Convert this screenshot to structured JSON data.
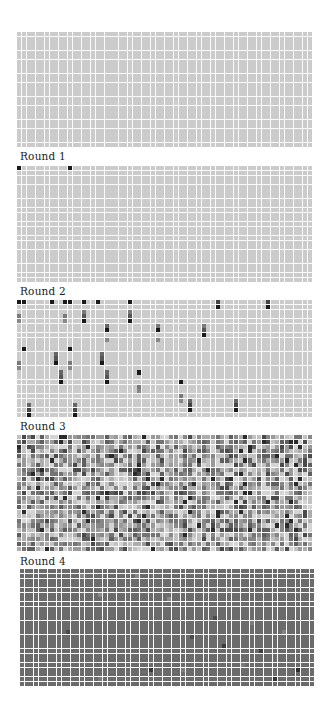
{
  "figure": {
    "top_text_bleed": "",
    "grid": {
      "cols": 64,
      "rows": 25
    },
    "colors": {
      "empty_light": "#c9c9c9",
      "black": "#1a1a1a",
      "dark": "#444444",
      "mid": "#7a7a7a",
      "light_mid": "#a8a8a8",
      "round4_base": "#6e6e6e"
    },
    "panels": [
      {
        "id": "initial",
        "label": "",
        "top": 32,
        "left": 17,
        "width": 295,
        "height": 115,
        "mode": "uniform",
        "base": "#cbcbcb",
        "cells": []
      },
      {
        "id": "round-1",
        "label": "Round 1",
        "label_top": 150,
        "top": 166,
        "left": 17,
        "width": 295,
        "height": 116,
        "mode": "sparse",
        "base": "#cbcbcb",
        "cells": [
          [
            0,
            0,
            "#1a1a1a"
          ],
          [
            11,
            0,
            "#1a1a1a"
          ]
        ]
      },
      {
        "id": "round-2",
        "label": "Round 2",
        "label_top": 285,
        "top": 300,
        "left": 17,
        "width": 295,
        "height": 117,
        "mode": "sparse",
        "base": "#cbcbcb",
        "cells": [
          [
            0,
            0,
            "#1a1a1a"
          ],
          [
            1,
            0,
            "#1a1a1a"
          ],
          [
            7,
            0,
            "#1a1a1a"
          ],
          [
            10,
            0,
            "#1a1a1a"
          ],
          [
            11,
            0,
            "#1a1a1a"
          ],
          [
            14,
            0,
            "#1a1a1a"
          ],
          [
            17,
            0,
            "#1a1a1a"
          ],
          [
            24,
            0,
            "#1a1a1a"
          ],
          [
            43,
            0,
            "#444444"
          ],
          [
            43,
            1,
            "#1a1a1a"
          ],
          [
            54,
            0,
            "#444444"
          ],
          [
            54,
            1,
            "#1a1a1a"
          ],
          [
            0,
            3,
            "#7a7a7a"
          ],
          [
            0,
            4,
            "#888888"
          ],
          [
            10,
            3,
            "#7a7a7a"
          ],
          [
            10,
            4,
            "#888888"
          ],
          [
            14,
            2,
            "#7a7a7a"
          ],
          [
            14,
            3,
            "#555555"
          ],
          [
            14,
            4,
            "#1a1a1a"
          ],
          [
            24,
            2,
            "#7a7a7a"
          ],
          [
            24,
            3,
            "#555555"
          ],
          [
            24,
            4,
            "#1a1a1a"
          ],
          [
            19,
            5,
            "#666666"
          ],
          [
            19,
            6,
            "#1a1a1a"
          ],
          [
            30,
            5,
            "#7a7a7a"
          ],
          [
            30,
            6,
            "#1a1a1a"
          ],
          [
            40,
            5,
            "#7a7a7a"
          ],
          [
            40,
            6,
            "#555555"
          ],
          [
            40,
            7,
            "#1a1a1a"
          ],
          [
            19,
            8,
            "#888888"
          ],
          [
            30,
            8,
            "#888888"
          ],
          [
            1,
            10,
            "#1a1a1a"
          ],
          [
            11,
            10,
            "#1a1a1a"
          ],
          [
            8,
            11,
            "#666666"
          ],
          [
            8,
            12,
            "#555555"
          ],
          [
            8,
            13,
            "#1a1a1a"
          ],
          [
            18,
            11,
            "#666666"
          ],
          [
            18,
            12,
            "#555555"
          ],
          [
            18,
            13,
            "#1a1a1a"
          ],
          [
            0,
            13,
            "#7a7a7a"
          ],
          [
            0,
            14,
            "#888888"
          ],
          [
            11,
            13,
            "#7a7a7a"
          ],
          [
            11,
            14,
            "#888888"
          ],
          [
            9,
            15,
            "#666666"
          ],
          [
            9,
            16,
            "#555555"
          ],
          [
            9,
            17,
            "#1a1a1a"
          ],
          [
            19,
            15,
            "#666666"
          ],
          [
            19,
            16,
            "#555555"
          ],
          [
            19,
            17,
            "#1a1a1a"
          ],
          [
            26,
            15,
            "#1a1a1a"
          ],
          [
            26,
            18,
            "#7a7a7a"
          ],
          [
            26,
            19,
            "#888888"
          ],
          [
            35,
            17,
            "#1a1a1a"
          ],
          [
            35,
            20,
            "#7a7a7a"
          ],
          [
            35,
            21,
            "#888888"
          ],
          [
            37,
            21,
            "#666666"
          ],
          [
            37,
            22,
            "#444444"
          ],
          [
            37,
            23,
            "#1a1a1a"
          ],
          [
            47,
            21,
            "#666666"
          ],
          [
            47,
            22,
            "#444444"
          ],
          [
            47,
            23,
            "#1a1a1a"
          ],
          [
            2,
            22,
            "#666666"
          ],
          [
            2,
            23,
            "#444444"
          ],
          [
            2,
            24,
            "#1a1a1a"
          ],
          [
            12,
            22,
            "#666666"
          ],
          [
            12,
            23,
            "#444444"
          ],
          [
            12,
            24,
            "#1a1a1a"
          ]
        ]
      },
      {
        "id": "round-3",
        "label": "Round 3",
        "label_top": 420,
        "top": 435,
        "left": 17,
        "width": 295,
        "height": 116,
        "mode": "random",
        "seed": 7,
        "palette": [
          "#d4d4d4",
          "#c2c2c2",
          "#adadad",
          "#9a9a9a",
          "#878787",
          "#747474",
          "#5f5f5f",
          "#4a4a4a",
          "#2a2a2a"
        ],
        "weights": [
          14,
          14,
          13,
          13,
          12,
          12,
          10,
          7,
          5
        ],
        "cells": []
      },
      {
        "id": "round-4",
        "label": "Round 4",
        "label_top": 555,
        "top": 569,
        "left": 20,
        "width": 294,
        "height": 117,
        "mode": "sparse",
        "base": "#6b6b6b",
        "cells": [
          [
            17,
            5,
            "#8a8a8a"
          ],
          [
            32,
            6,
            "#8a8a8a"
          ],
          [
            25,
            1,
            "#8a8a8a"
          ],
          [
            13,
            1,
            "#858585"
          ],
          [
            10,
            13,
            "#4a4a4a"
          ],
          [
            42,
            10,
            "#4a4a4a"
          ],
          [
            45,
            4,
            "#7c7c7c"
          ],
          [
            37,
            14,
            "#4a4a4a"
          ],
          [
            50,
            11,
            "#7c7c7c"
          ],
          [
            52,
            17,
            "#3e3e3e"
          ],
          [
            35,
            21,
            "#7c7c7c"
          ],
          [
            48,
            20,
            "#7c7c7c"
          ],
          [
            28,
            21,
            "#353535"
          ],
          [
            17,
            23,
            "#7c7c7c"
          ],
          [
            55,
            23,
            "#353535"
          ],
          [
            57,
            13,
            "#838383"
          ],
          [
            44,
            16,
            "#3a3a3a"
          ],
          [
            60,
            21,
            "#2e2e2e"
          ]
        ]
      }
    ]
  }
}
